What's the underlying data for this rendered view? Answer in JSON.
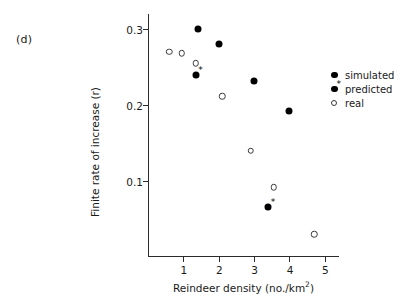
{
  "panel": {
    "label": "(d)"
  },
  "legend": {
    "entries": [
      {
        "label": "simulated",
        "marker": "filled-circle"
      },
      {
        "label": "predicted",
        "marker": "filled-circle-asterisk"
      },
      {
        "label": "real",
        "marker": "open-circle"
      }
    ]
  },
  "chart_data": {
    "type": "scatter",
    "title": "",
    "xlabel": "Reindeer density (no./km2)",
    "xlabel_base": "Reindeer density (no./km",
    "xlabel_sup": "2",
    "xlabel_tail": ")",
    "ylabel": "Finite rate of increase (r)",
    "xlim": [
      0,
      5.4
    ],
    "ylim": [
      0,
      0.32
    ],
    "xticks": [
      1,
      2,
      3,
      4,
      5
    ],
    "xticklabels": [
      "1",
      "2",
      "3",
      "4",
      "5"
    ],
    "yticks": [
      0.1,
      0.2,
      0.3
    ],
    "yticklabels": [
      "0.1",
      "0.2",
      "0.3"
    ],
    "grid": false,
    "legend_position": "right",
    "series": [
      {
        "name": "simulated",
        "marker": "filled-circle",
        "color": "#000000",
        "points": [
          {
            "x": 1.4,
            "y": 0.3
          },
          {
            "x": 2.0,
            "y": 0.281
          },
          {
            "x": 3.0,
            "y": 0.232
          },
          {
            "x": 4.0,
            "y": 0.192
          }
        ]
      },
      {
        "name": "predicted",
        "marker": "filled-circle-asterisk",
        "color": "#000000",
        "points": [
          {
            "x": 1.35,
            "y": 0.24
          },
          {
            "x": 3.4,
            "y": 0.066
          }
        ]
      },
      {
        "name": "real",
        "marker": "open-circle",
        "color": "#3a3a3a",
        "points": [
          {
            "x": 0.6,
            "y": 0.27
          },
          {
            "x": 0.95,
            "y": 0.268
          },
          {
            "x": 1.35,
            "y": 0.255
          },
          {
            "x": 2.1,
            "y": 0.212
          },
          {
            "x": 2.9,
            "y": 0.14
          },
          {
            "x": 3.55,
            "y": 0.092
          },
          {
            "x": 4.7,
            "y": 0.03
          }
        ]
      }
    ]
  }
}
